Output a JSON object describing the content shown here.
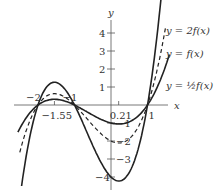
{
  "chart_data": {
    "type": "line",
    "title": "",
    "xlabel": "x",
    "ylabel": "y",
    "base_function": "f(x) = (x+2)(x+1)(x-1)",
    "x_ticks": [
      {
        "value": -2,
        "label": "-2"
      },
      {
        "value": -1.55,
        "label": "-1.55"
      },
      {
        "value": -1,
        "label": "-1"
      },
      {
        "value": 0.21,
        "label": "0.21"
      },
      {
        "value": 1,
        "label": "1"
      }
    ],
    "y_ticks": [
      {
        "value": 4,
        "label": "4"
      },
      {
        "value": 3,
        "label": "3"
      },
      {
        "value": 2,
        "label": "2"
      },
      {
        "value": 1,
        "label": "1"
      },
      {
        "value": -1,
        "label": "-1"
      },
      {
        "value": -2,
        "label": "-2"
      },
      {
        "value": -3,
        "label": "-3"
      },
      {
        "value": -4,
        "label": "-4"
      }
    ],
    "series": [
      {
        "name": "y = 2f(x)",
        "scale": 2,
        "style": "solid",
        "x_range": [
          -2.45,
          1.38
        ],
        "key_points": [
          [
            -2,
            0
          ],
          [
            -1.55,
            1.26
          ],
          [
            -1,
            0
          ],
          [
            0.21,
            -4.23
          ],
          [
            1,
            0
          ]
        ]
      },
      {
        "name": "y = f(x)",
        "scale": 1,
        "style": "dashed",
        "x_range": [
          -2.5,
          1.5
        ],
        "key_points": [
          [
            -2,
            0
          ],
          [
            -1.55,
            0.63
          ],
          [
            -1,
            0
          ],
          [
            0.21,
            -2.11
          ],
          [
            1,
            0
          ]
        ]
      },
      {
        "name": "y = ½f(x)",
        "scale": 0.5,
        "style": "solid",
        "x_range": [
          -2.55,
          1.6
        ],
        "key_points": [
          [
            -2,
            0
          ],
          [
            -1.55,
            0.32
          ],
          [
            -1,
            0
          ],
          [
            0.21,
            -1.06
          ],
          [
            1,
            0
          ]
        ]
      }
    ],
    "xlim": [
      -2.6,
      2.4
    ],
    "ylim": [
      -4.3,
      4.8
    ],
    "grid": false,
    "legend": "inline labels at right"
  },
  "labels": {
    "two_f": "y = 2f(x)",
    "f": "y = f(x)",
    "half_f": "y = ½f(x)",
    "x_axis": "x",
    "y_axis": "y"
  }
}
